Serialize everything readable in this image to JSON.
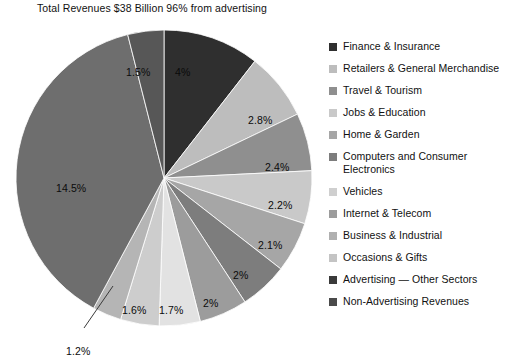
{
  "chart_title": "Total Revenues $38 Billion 96% from advertising",
  "chart_data": {
    "type": "pie",
    "title": "Total Revenues $38 Billion 96% from advertising",
    "xlabel": "",
    "ylabel": "",
    "legend_position": "right",
    "start_angle_deg": 0,
    "direction": "clockwise",
    "categories": [
      "Finance & Insurance",
      "Retailers & General Merchandise",
      "Travel & Tourism",
      "Jobs & Education",
      "Home & Garden",
      "Computers and Consumer Electronics",
      "Vehicles",
      "Internet & Telecom",
      "Business & Industrial",
      "Occasions & Gifts",
      "Advertising — Other Sectors",
      "Non-Advertising Revenues"
    ],
    "values": [
      4,
      2.8,
      2.4,
      2.2,
      2.1,
      2,
      2,
      1.7,
      1.6,
      1.2,
      65.5,
      14.5
    ],
    "value_labels": [
      "4%",
      "2.8%",
      "2.4%",
      "2.2%",
      "2.1%",
      "2%",
      "2%",
      "1.7%",
      "1.6%",
      "1.2%",
      "1.5%",
      "14.5%"
    ],
    "colors": [
      "#2f2f2f",
      "#bdbdbd",
      "#8f8f8f",
      "#c9c9c9",
      "#a6a6a6",
      "#7d7d7d",
      "#9c9c9c",
      "#e2e2e2",
      "#cdcdcd",
      "#b5b5b5",
      "#575757",
      "#6e6e6e"
    ]
  },
  "slices": [
    {
      "label": "4%",
      "pct": 4,
      "color": "#2f2f2f",
      "legend_index": 0,
      "lx": 175,
      "ly": 52,
      "dark": true
    },
    {
      "label": "2.8%",
      "pct": 2.8,
      "color": "#bdbdbd",
      "legend_index": 1,
      "lx": 248,
      "ly": 100,
      "dark": false
    },
    {
      "label": "2.4%",
      "pct": 2.4,
      "color": "#8f8f8f",
      "legend_index": 2,
      "lx": 265,
      "ly": 147,
      "dark": false
    },
    {
      "label": "2.2%",
      "pct": 2.2,
      "color": "#c9c9c9",
      "legend_index": 3,
      "lx": 268,
      "ly": 185,
      "dark": false
    },
    {
      "label": "2.1%",
      "pct": 2.1,
      "color": "#a6a6a6",
      "legend_index": 4,
      "lx": 258,
      "ly": 225,
      "dark": false
    },
    {
      "label": "2%",
      "pct": 2,
      "color": "#7d7d7d",
      "legend_index": 5,
      "lx": 233,
      "ly": 255,
      "dark": false
    },
    {
      "label": "2%",
      "pct": 2,
      "color": "#9c9c9c",
      "legend_index": 6,
      "lx": 203,
      "ly": 283,
      "dark": false
    },
    {
      "label": "1.7%",
      "pct": 1.7,
      "color": "#e2e2e2",
      "legend_index": 7,
      "lx": 159,
      "ly": 290,
      "dark": false
    },
    {
      "label": "1.6%",
      "pct": 1.6,
      "color": "#cdcdcd",
      "legend_index": 8,
      "lx": 122,
      "ly": 290,
      "dark": false
    },
    {
      "label": "1.2%",
      "pct": 1.2,
      "color": "#b5b5b5",
      "legend_index": 9,
      "lx": 66,
      "ly": 331,
      "dark": false
    },
    {
      "label": "14.5%",
      "pct": 14.5,
      "color": "#6e6e6e",
      "legend_index": 11,
      "lx": 56,
      "ly": 168,
      "dark": false
    },
    {
      "label": "1.5%",
      "pct": 1.5,
      "color": "#575757",
      "legend_index": 10,
      "lx": 126,
      "ly": 52,
      "dark": false
    }
  ],
  "legend": {
    "items": [
      {
        "label": "Finance & Insurance",
        "color": "#2f2f2f",
        "two_line": false
      },
      {
        "label": "Retailers & General Merchandise",
        "color": "#bdbdbd",
        "two_line": false
      },
      {
        "label": "Travel & Tourism",
        "color": "#8f8f8f",
        "two_line": false
      },
      {
        "label": "Jobs & Education",
        "color": "#c9c9c9",
        "two_line": false
      },
      {
        "label": "Home & Garden",
        "color": "#a6a6a6",
        "two_line": false
      },
      {
        "label": "Computers and Consumer Electronics",
        "color": "#7d7d7d",
        "two_line": true
      },
      {
        "label": "Vehicles",
        "color": "#cfcfcf",
        "two_line": false
      },
      {
        "label": "Internet & Telecom",
        "color": "#9c9c9c",
        "two_line": false
      },
      {
        "label": "Business & Industrial",
        "color": "#b0b0b0",
        "two_line": false
      },
      {
        "label": "Occasions & Gifts",
        "color": "#c4c4c4",
        "two_line": false
      },
      {
        "label": "Advertising — Other Sectors",
        "color": "#3a3a3a",
        "two_line": false
      },
      {
        "label": "Non-Advertising Revenues",
        "color": "#4a4a4a",
        "two_line": false
      }
    ]
  }
}
